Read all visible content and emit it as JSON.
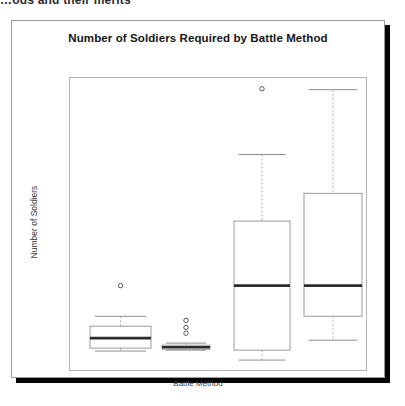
{
  "top_clipped_text": "…ods and their merits",
  "card": {
    "title": "Number of Soldiers Required by Battle Method"
  },
  "chart_data": {
    "type": "boxplot",
    "title": "Number of Soldiers Required by Battle Method",
    "xlabel": "Battle Method",
    "ylabel": "Number of Soldiers",
    "grid": false,
    "legend": "none",
    "y_tick_labels": [],
    "x_tick_labels": [],
    "ylim": [
      0,
      100
    ],
    "note": "Axes are unlabeled; values below are read off pixel positions and expressed on a 0-100 relative scale where 0 is the panel bottom and 100 the panel top.",
    "boxes": [
      {
        "name": "method-1",
        "index": 0,
        "x_center": 106.5,
        "x_left": 76,
        "x_right": 137,
        "whisker_high": 18.4,
        "q3": 15.0,
        "median": 10.9,
        "q1": 7.5,
        "whisker_low": 6.5,
        "outliers": [
          28.9
        ]
      },
      {
        "name": "method-2",
        "index": 1,
        "x_center": 172,
        "x_left": 148,
        "x_right": 196,
        "whisker_high": 9.2,
        "q3": 8.5,
        "median": 7.8,
        "q1": 7.1,
        "whisker_low": 6.8,
        "outliers": [
          17.0,
          14.6,
          12.6
        ]
      },
      {
        "name": "method-3",
        "index": 2,
        "x_center": 248,
        "x_left": 220,
        "x_right": 276,
        "whisker_high": 73.8,
        "q3": 51.0,
        "median": 28.9,
        "q1": 6.8,
        "whisker_low": 3.4,
        "outliers": [
          96.3
        ]
      },
      {
        "name": "method-4",
        "index": 3,
        "x_center": 319,
        "x_left": 290,
        "x_right": 348,
        "whisker_high": 96.0,
        "q3": 60.5,
        "median": 28.9,
        "q1": 18.4,
        "whisker_low": 10.2,
        "outliers": []
      }
    ]
  }
}
